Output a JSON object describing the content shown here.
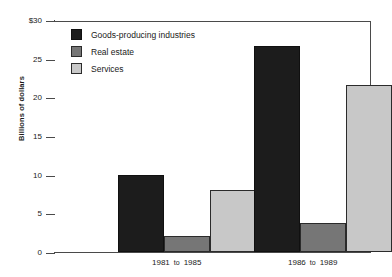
{
  "chart_data": {
    "type": "bar",
    "title": "",
    "subtitle": "",
    "xlabel": "",
    "ylabel": "Billions of dollars",
    "ylim": [
      0,
      30
    ],
    "ytick_values": [
      0,
      5,
      10,
      15,
      20,
      25,
      30
    ],
    "ytick_labels": [
      "0",
      "5",
      "10",
      "15",
      "20",
      "25",
      "$30"
    ],
    "grid": false,
    "legend_position": "top-left-inside",
    "categories": [
      "1981 to 1985",
      "1986 to 1989"
    ],
    "category_parts": [
      {
        "start": "1981",
        "connector": "to",
        "end": "1985"
      },
      {
        "start": "1986",
        "connector": "to",
        "end": "1989"
      }
    ],
    "series": [
      {
        "name": "Goods-producing industries",
        "color": "#1c1c1c",
        "values": [
          10.0,
          26.7
        ]
      },
      {
        "name": "Real estate",
        "color": "#767676",
        "values": [
          2.1,
          3.8
        ]
      },
      {
        "name": "Services",
        "color": "#c8c8c8",
        "values": [
          8.0,
          21.6
        ]
      }
    ]
  },
  "legend": {
    "items": [
      {
        "label": "Goods-producing industries",
        "swatch": "goods"
      },
      {
        "label": "Real estate",
        "swatch": "realestate"
      },
      {
        "label": "Services",
        "swatch": "services"
      }
    ]
  }
}
